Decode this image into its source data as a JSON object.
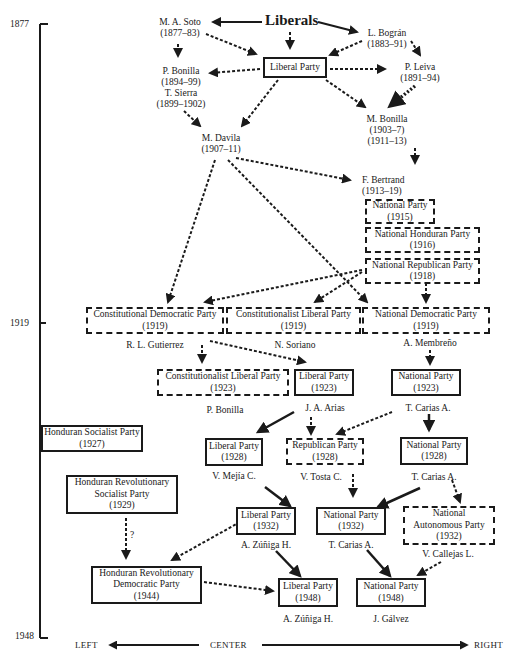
{
  "timeline": {
    "start": "1877",
    "mid": "1919",
    "end": "1948"
  },
  "axis": {
    "left": "LEFT",
    "center": "CENTER",
    "right": "RIGHT"
  },
  "title": "Liberals",
  "nodes": {
    "soto": {
      "name": "M. A. Soto",
      "years": "(1877–83)"
    },
    "bogran": {
      "name": "L. Bográn",
      "years": "(1883–91)"
    },
    "liberal_party": {
      "name": "Liberal Party"
    },
    "pbonilla_sierra": {
      "l1": "P. Bonilla",
      "l2": "(1894–99)",
      "l3": "T. Sierra",
      "l4": "(1899–1902)"
    },
    "leiva": {
      "name": "P. Leiva",
      "years": "(1891–94)"
    },
    "mbonilla": {
      "name": "M. Bonilla",
      "years1": "(1903–7)",
      "years2": "(1911–13)"
    },
    "davila": {
      "name": "M. Davila",
      "years": "(1907–11)"
    },
    "bertrand": {
      "name": "F. Bertrand",
      "years": "(1913–19)"
    },
    "np1915": {
      "name": "National Party",
      "year": "(1915)"
    },
    "nhp1916": {
      "name": "National Honduran Party",
      "year": "(1916)"
    },
    "nrp1918": {
      "name": "National Republican Party",
      "year": "(1918)"
    },
    "cdp1919": {
      "name": "Constitutional Democratic Party",
      "year": "(1919)",
      "leader": "R. L. Gutierrez"
    },
    "clp1919": {
      "name": "Constitutionalist Liberal Party",
      "year": "(1919)",
      "leader": "N. Soriano"
    },
    "ndp1919": {
      "name": "National Democratic Party",
      "year": "(1919)",
      "leader": "A. Membreño"
    },
    "clp1923": {
      "name": "Constitutionalist Liberal Party",
      "year": "(1923)",
      "leader": "P. Bonilla"
    },
    "lp1923": {
      "name": "Liberal Party",
      "year": "(1923)",
      "leader": "J. A. Arias"
    },
    "np1923": {
      "name": "National Party",
      "year": "(1923)",
      "leader": "T. Carias A."
    },
    "hsp1927": {
      "name": "Honduran Socialist Party",
      "year": "(1927)"
    },
    "lp1928": {
      "name": "Liberal Party",
      "year": "(1928)",
      "leader": "V. Mejía C."
    },
    "rp1928": {
      "name": "Republican Party",
      "year": "(1928)",
      "leader": "V. Tosta C."
    },
    "np1928": {
      "name": "National Party",
      "year": "(1928)",
      "leader": "T. Carias A."
    },
    "hrsp1929": {
      "l1": "Honduran Revolutionary",
      "l2": "Socialist Party",
      "year": "(1929)"
    },
    "question": "?",
    "lp1932": {
      "name": "Liberal Party",
      "year": "(1932)",
      "leader": "A. Zúñiga H."
    },
    "np1932": {
      "name": "National Party",
      "year": "(1932)",
      "leader": "T. Carias A."
    },
    "nap1932": {
      "l1": "National",
      "l2": "Autonomous Party",
      "year": "(1932)",
      "leader": "V. Callejas L."
    },
    "hrdp1944": {
      "l1": "Honduran Revolutionary",
      "l2": "Democratic Party",
      "year": "(1944)"
    },
    "lp1948": {
      "name": "Liberal Party",
      "year": "(1948)",
      "leader": "A. Zúñiga H."
    },
    "np1948": {
      "name": "National Party",
      "year": "(1948)",
      "leader": "J. Gálvez"
    }
  },
  "colors": {
    "ink": "#1a1a1a",
    "background": "#ffffff"
  }
}
